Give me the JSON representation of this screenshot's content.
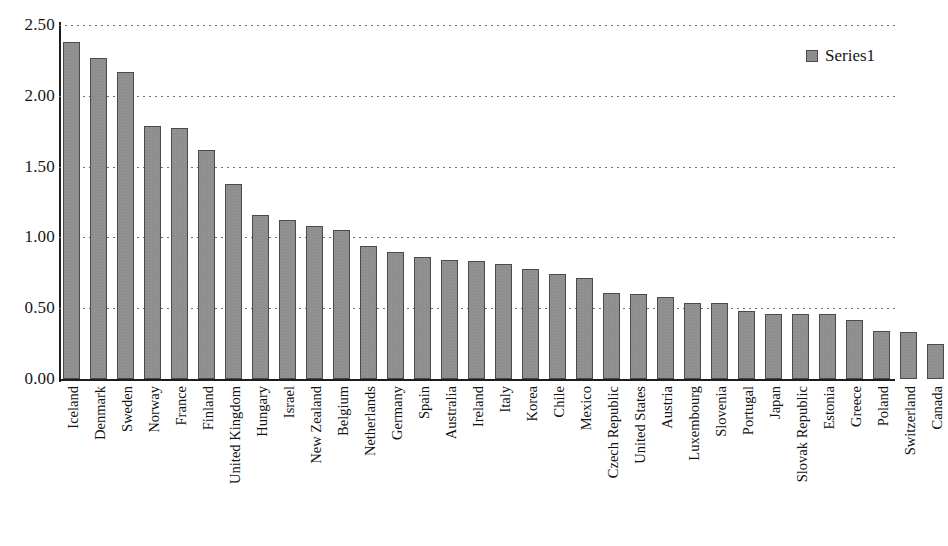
{
  "chart_data": {
    "type": "bar",
    "title": "",
    "xlabel": "",
    "ylabel": "",
    "ylim": [
      0,
      2.5
    ],
    "ytick_interval": 0.5,
    "ytick_labels": [
      "2.50",
      "2.00",
      "1.50",
      "1.00",
      "0.50",
      "0.00"
    ],
    "ytick_values": [
      2.5,
      2.0,
      1.5,
      1.0,
      0.5,
      0.0
    ],
    "grid": true,
    "grid_style": "dotted-horizontal",
    "legend_position": "top-right",
    "legend": [
      "Series1"
    ],
    "series_name": "Series1",
    "bar_color": "#8e8e8e",
    "bar_border_color": "#4a4a4a",
    "categories": [
      "Iceland",
      "Denmark",
      "Sweden",
      "Norway",
      "France",
      "Finland",
      "United Kingdom",
      "Hungary",
      "Israel",
      "New Zealand",
      "Belgium",
      "Netherlands",
      "Germany",
      "Spain",
      "Australia",
      "Ireland",
      "Italy",
      "Korea",
      "Chile",
      "Mexico",
      "Czech Republic",
      "United States",
      "Austria",
      "Luxembourg",
      "Slovenia",
      "Portugal",
      "Japan",
      "Slovak Republic",
      "Estonia",
      "Greece",
      "Poland",
      "Switzerland",
      "Canada"
    ],
    "values": [
      2.38,
      2.27,
      2.17,
      1.79,
      1.77,
      1.62,
      1.38,
      1.16,
      1.12,
      1.08,
      1.05,
      0.94,
      0.9,
      0.86,
      0.84,
      0.83,
      0.81,
      0.78,
      0.74,
      0.71,
      0.61,
      0.6,
      0.58,
      0.54,
      0.54,
      0.48,
      0.46,
      0.46,
      0.46,
      0.42,
      0.34,
      0.33,
      0.25
    ]
  }
}
